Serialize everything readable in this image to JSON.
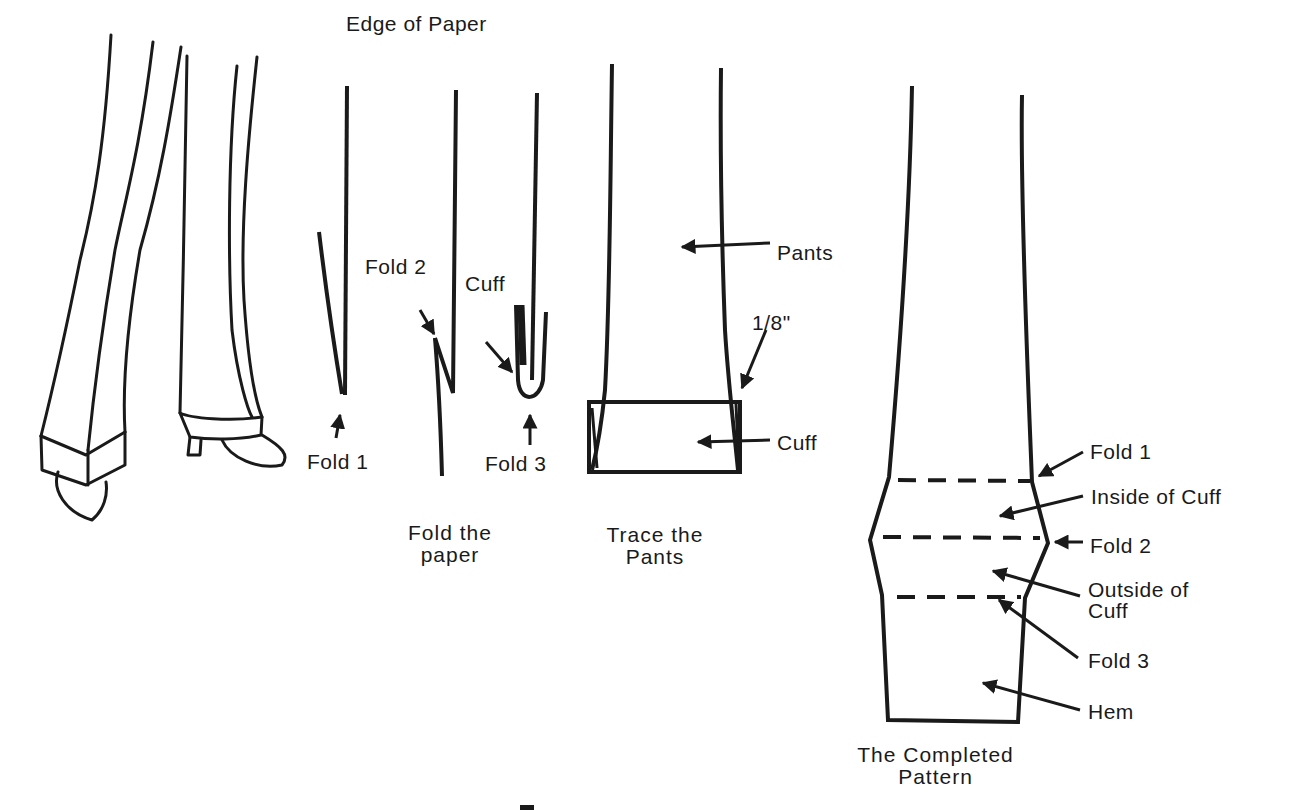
{
  "diagram": {
    "ink_color": "#1a1a1a",
    "background": "#ffffff",
    "panels": [
      {
        "id": "pants-on-legs",
        "caption": ""
      },
      {
        "id": "fold-the-paper",
        "caption_line1": "Fold the",
        "caption_line2": "paper"
      },
      {
        "id": "trace-the-pants",
        "caption_line1": "Trace the",
        "caption_line2": "Pants"
      },
      {
        "id": "completed-pattern",
        "caption_line1": "The Completed",
        "caption_line2": "Pattern"
      }
    ],
    "fold_paper_labels": {
      "edge_of_paper": "Edge of Paper",
      "fold1": "Fold 1",
      "fold2": "Fold 2",
      "cuff": "Cuff",
      "fold3": "Fold 3"
    },
    "trace_labels": {
      "pants": "Pants",
      "allowance": "1/8\"",
      "cuff": "Cuff"
    },
    "pattern_labels": {
      "fold1": "Fold 1",
      "inside_of_cuff": "Inside of Cuff",
      "fold2": "Fold 2",
      "outside_of_cuff_line1": "Outside of",
      "outside_of_cuff_line2": "Cuff",
      "fold3": "Fold 3",
      "hem": "Hem"
    },
    "figure_caption_partial": "Figure"
  }
}
